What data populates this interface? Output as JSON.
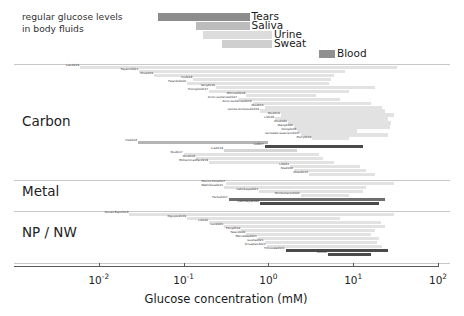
{
  "figure": {
    "caption_fluids": "regular glucose levels\nin body fluids",
    "axis": {
      "title": "Glucose concentration (mM)",
      "scale": "log10",
      "xmin_exp": -3,
      "xmax_exp": 2,
      "tick_exponents": [
        -2,
        -1,
        0,
        1,
        2
      ],
      "tick_labels": [
        "10−2",
        "10−1",
        "10⁰",
        "10¹",
        "10²"
      ],
      "tick_mantissa": "10",
      "tick_sups": [
        "-2",
        "-1",
        "0",
        "1",
        "2"
      ]
    },
    "sections": [
      {
        "id": "carbon",
        "label": "Carbon"
      },
      {
        "id": "metal",
        "label": "Metal"
      },
      {
        "id": "npnw",
        "label": "NP / NW"
      }
    ],
    "colors": {
      "bar_light": "#e2e2e2",
      "bar_mid": "#b4b4b4",
      "bar_dark": "#6e6e6e",
      "bar_darkest": "#4a4a4a",
      "fluid_tears": "#8c8c8c",
      "fluid_saliva": "#bcbcbc",
      "fluid_urine": "#dcdcdc",
      "fluid_sweat": "#cfcfcf",
      "fluid_blood": "#909090",
      "separator": "#c9c9c9",
      "axis": "#5a5a5a",
      "text": "#1a1a1a"
    }
  },
  "chart_data": {
    "type": "bar",
    "title": "",
    "xlabel": "Glucose concentration (mM)",
    "ylabel": "",
    "xscale": "log",
    "xlim": [
      0.001,
      100
    ],
    "grid": false,
    "legend": "none",
    "note": "Horizontal range bars: each bar spans the detection range (min-max glucose concentration, mM) reported by one study. Top block shows physiological glucose ranges in body fluids.",
    "body_fluids": {
      "categories": [
        "Tears",
        "Saliva",
        "Urine",
        "Sweat",
        "Blood"
      ],
      "ranges_mM": [
        [
          0.05,
          0.6
        ],
        [
          0.14,
          0.6
        ],
        [
          0.17,
          1.1
        ],
        [
          0.28,
          1.1
        ],
        [
          3.9,
          6.1
        ]
      ],
      "shades": [
        "#8c8c8c",
        "#bcbcbc",
        "#dcdcdc",
        "#cfcfcf",
        "#909090"
      ]
    },
    "series": [
      {
        "name": "Carbon",
        "studies": [
          {
            "label": "Cao2019",
            "range_mM": [
              0.006,
              33.0
            ],
            "shade": "#e2e2e2"
          },
          {
            "label": "Fayemi2021",
            "range_mM": [
              0.03,
              8.0
            ],
            "shade": "#e2e2e2"
          },
          {
            "label": "Shu2019",
            "range_mM": [
              0.045,
              6.0
            ],
            "shade": "#e2e2e2"
          },
          {
            "label": "Xu2018",
            "range_mM": [
              0.13,
              5.5
            ],
            "shade": "#e2e2e2"
          },
          {
            "label": "Fajardo2020",
            "range_mM": [
              0.11,
              5.2
            ],
            "shade": "#e2e2e2"
          },
          {
            "label": "Yang2019",
            "range_mM": [
              0.24,
              18.0
            ],
            "shade": "#e2e2e2"
          },
          {
            "label": "Hoongbo2017",
            "range_mM": [
              0.2,
              9.0
            ],
            "shade": "#e2e2e2"
          },
          {
            "label": "Mitchell2018",
            "range_mM": [
              0.55,
              3.6
            ],
            "shade": "#e2e2e2"
          },
          {
            "label": "Amor-Gutierrez2017",
            "range_mM": [
              0.44,
              7.0
            ],
            "shade": "#e2e2e2"
          },
          {
            "label": "Amor-Gutierrez2019",
            "range_mM": [
              0.65,
              16.0
            ],
            "shade": "#e2e2e2"
          },
          {
            "label": "Niu2016",
            "range_mM": [
              0.9,
              22.0
            ],
            "shade": "#e2e2e2"
          },
          {
            "label": "Lemos-Ambuludi2019",
            "range_mM": [
              0.8,
              24.0
            ],
            "shade": "#e2e2e2"
          },
          {
            "label": "Wu2019",
            "range_mM": [
              1.4,
              30.0
            ],
            "shade": "#e2e2e2"
          },
          {
            "label": "Li2018",
            "range_mM": [
              1.2,
              26.0
            ],
            "shade": "#e2e2e2"
          },
          {
            "label": "Zhu2020",
            "range_mM": [
              1.7,
              28.0
            ],
            "shade": "#e2e2e2"
          },
          {
            "label": "Wang2020",
            "range_mM": [
              2.0,
              27.0
            ],
            "shade": "#e2e2e2"
          },
          {
            "label": "Dong2018",
            "range_mM": [
              2.2,
              11.0
            ],
            "shade": "#e2e2e2"
          },
          {
            "label": "Gonzalez-Guerrero2017",
            "range_mM": [
              2.4,
              26.0
            ],
            "shade": "#e2e2e2"
          },
          {
            "label": "Perry2019",
            "range_mM": [
              3.3,
              9.0
            ],
            "shade": "#e2e2e2"
          },
          {
            "label": "Xie2018",
            "range_mM": [
              0.029,
              1.0
            ],
            "shade": "#b4b4b4"
          },
          {
            "label": "Li2017",
            "range_mM": [
              0.9,
              13.0
            ],
            "shade": "#4a4a4a"
          },
          {
            "label": "Cai2019",
            "range_mM": [
              0.3,
              2.2
            ],
            "shade": "#d5d5d5"
          },
          {
            "label": "Niu2017",
            "range_mM": [
              0.1,
              4.0
            ],
            "shade": "#e2e2e2"
          },
          {
            "label": "Niu2018",
            "range_mM": [
              0.14,
              4.4
            ],
            "shade": "#e2e2e2"
          },
          {
            "label": "Mohammadifar2019",
            "range_mM": [
              0.2,
              6.0
            ],
            "shade": "#e2e2e2"
          },
          {
            "label": "Li2021",
            "range_mM": [
              1.8,
              12.0
            ],
            "shade": "#e2e2e2"
          },
          {
            "label": "Nie2016",
            "range_mM": [
              2.0,
              14.0
            ],
            "shade": "#e2e2e2"
          },
          {
            "label": "Zhao2013",
            "range_mM": [
              3.0,
              18.0
            ],
            "shade": "#e2e2e2"
          }
        ]
      },
      {
        "name": "Metal",
        "studies": [
          {
            "label": "Munoz-Rios2017",
            "range_mM": [
              0.32,
              30.0
            ],
            "shade": "#e2e2e2"
          },
          {
            "label": "Wakhikwa2021",
            "range_mM": [
              0.3,
              14.0
            ],
            "shade": "#e2e2e2"
          },
          {
            "label": "Cetinkaya2021",
            "range_mM": [
              0.78,
              13.0
            ],
            "shade": "#e2e2e2"
          },
          {
            "label": "Wimbuharjo2022",
            "range_mM": [
              2.4,
              9.0
            ],
            "shade": "#e2e2e2"
          },
          {
            "label": "Ferbu2017",
            "range_mM": [
              0.34,
              24.0
            ],
            "shade": "#6e6e6e"
          },
          {
            "label": "Cetinkaya2022",
            "range_mM": [
              0.8,
              20.0
            ],
            "shade": "#4a4a4a"
          }
        ]
      },
      {
        "name": "NP / NW",
        "studies": [
          {
            "label": "Nunez-Bajo2019",
            "range_mM": [
              0.023,
              30.0
            ],
            "shade": "#e2e2e2"
          },
          {
            "label": "Nguyen2019",
            "range_mM": [
              0.11,
              7.0
            ],
            "shade": "#e2e2e2"
          },
          {
            "label": "Li2022",
            "range_mM": [
              0.2,
              21.0
            ],
            "shade": "#e2e2e2"
          },
          {
            "label": "Luo2020",
            "range_mM": [
              0.3,
              24.0
            ],
            "shade": "#e2e2e2"
          },
          {
            "label": "Feng2014",
            "range_mM": [
              0.48,
              18.0
            ],
            "shade": "#e2e2e2"
          },
          {
            "label": "Talari2020",
            "range_mM": [
              0.55,
              16.0
            ],
            "shade": "#e2e2e2"
          },
          {
            "label": "Mercedes2021",
            "range_mM": [
              0.75,
              20.0
            ],
            "shade": "#e2e2e2"
          },
          {
            "label": "Gupta2021",
            "range_mM": [
              0.9,
              19.0
            ],
            "shade": "#e2e2e2"
          },
          {
            "label": "Srivastav2021",
            "range_mM": [
              0.95,
              22.0
            ],
            "shade": "#e2e2e2"
          },
          {
            "label": "Thiruvala2011",
            "range_mM": [
              1.6,
              26.0
            ],
            "shade": "#4a4a4a"
          },
          {
            "label": "Li2019",
            "range_mM": [
              5.0,
              16.0
            ],
            "shade": "#4a4a4a"
          }
        ]
      }
    ]
  }
}
